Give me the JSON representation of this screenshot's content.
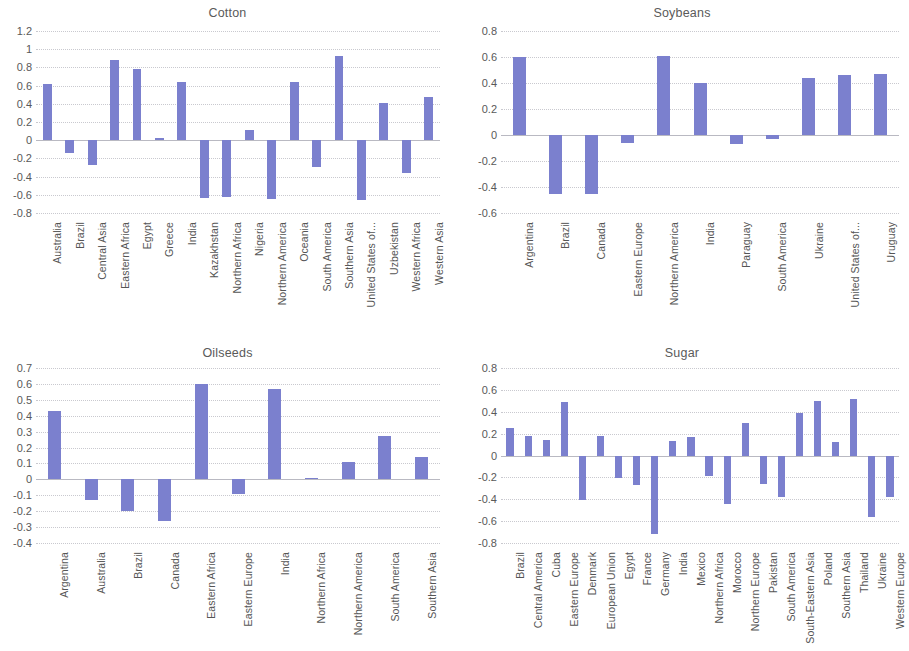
{
  "figure": {
    "background": "#ffffff",
    "bar_color": "#7b80ce",
    "gridline_color": "#c9c9cf"
  },
  "panels": [
    {
      "id": "cotton",
      "title": "Cotton"
    },
    {
      "id": "soybeans",
      "title": "Soybeans"
    },
    {
      "id": "oilseeds",
      "title": "Oilseeds"
    },
    {
      "id": "sugar",
      "title": "Sugar"
    }
  ],
  "chart_data": [
    {
      "type": "bar",
      "title": "Cotton",
      "xlabel": "",
      "ylabel": "",
      "ylim": [
        -0.8,
        1.2
      ],
      "ytick_step": 0.2,
      "yticks": [
        "1.2",
        "1",
        "0.8",
        "0.6",
        "0.4",
        "0.2",
        "0",
        "-0.2",
        "-0.4",
        "-0.6",
        "-0.8"
      ],
      "grid": true,
      "legend": "none",
      "categories": [
        "Australia",
        "Brazil",
        "Central Asia",
        "Eastern Africa",
        "Egypt",
        "Greece",
        "India",
        "Kazakhstan",
        "Northern Africa",
        "Nigeria",
        "Northern America",
        "Oceania",
        "South America",
        "Southern Asia",
        "United States of...",
        "Uzbekistan",
        "Western Africa",
        "Western Asia"
      ],
      "values": [
        0.62,
        -0.14,
        -0.27,
        0.88,
        0.78,
        0.02,
        0.64,
        -0.63,
        -0.62,
        0.11,
        -0.65,
        0.64,
        -0.3,
        0.93,
        -0.66,
        0.41,
        -0.36,
        0.48
      ]
    },
    {
      "type": "bar",
      "title": "Soybeans",
      "xlabel": "",
      "ylabel": "",
      "ylim": [
        -0.6,
        0.8
      ],
      "ytick_step": 0.2,
      "yticks": [
        "0.8",
        "0.6",
        "0.4",
        "0.2",
        "0",
        "-0.2",
        "-0.4",
        "-0.6"
      ],
      "grid": true,
      "legend": "none",
      "categories": [
        "Argentina",
        "Brazil",
        "Canada",
        "Eastern Europe",
        "Northern America",
        "India",
        "Paraguay",
        "South America",
        "Ukraine",
        "United States of...",
        "Uruguay"
      ],
      "values": [
        0.6,
        -0.45,
        -0.45,
        -0.06,
        0.61,
        0.4,
        -0.07,
        -0.03,
        0.44,
        0.46,
        0.47
      ]
    },
    {
      "type": "bar",
      "title": "Oilseeds",
      "xlabel": "",
      "ylabel": "",
      "ylim": [
        -0.4,
        0.7
      ],
      "ytick_step": 0.1,
      "yticks": [
        "0.7",
        "0.6",
        "0.5",
        "0.4",
        "0.3",
        "0.2",
        "0.1",
        "0",
        "-0.1",
        "-0.2",
        "-0.3",
        "-0.4"
      ],
      "grid": true,
      "legend": "none",
      "categories": [
        "Argentina",
        "Australia",
        "Brazil",
        "Canada",
        "Eastern Africa",
        "Eastern Europe",
        "India",
        "Northern Africa",
        "Northern America",
        "South America",
        "Southern Asia"
      ],
      "values": [
        0.43,
        -0.13,
        -0.2,
        -0.26,
        0.6,
        -0.09,
        0.57,
        0.01,
        0.11,
        0.27,
        0.14
      ]
    },
    {
      "type": "bar",
      "title": "Sugar",
      "xlabel": "",
      "ylabel": "",
      "ylim": [
        -0.8,
        0.8
      ],
      "ytick_step": 0.2,
      "yticks": [
        "0.8",
        "0.6",
        "0.4",
        "0.2",
        "0",
        "-0.2",
        "-0.4",
        "-0.6",
        "-0.8"
      ],
      "grid": true,
      "legend": "none",
      "categories": [
        "Brazil",
        "Central America",
        "Cuba",
        "Eastern Europe",
        "Denmark",
        "European Union",
        "Egypt",
        "France",
        "Germany",
        "India",
        "Mexico",
        "Northern Africa",
        "Morocco",
        "Northern Europe",
        "Pakistan",
        "South America",
        "South-Eastern Asia",
        "Poland",
        "Southern Asia",
        "Thailand",
        "Ukraine",
        "Western Europe"
      ],
      "values": [
        0.25,
        0.18,
        0.14,
        0.49,
        -0.41,
        0.18,
        -0.21,
        -0.27,
        -0.72,
        0.13,
        0.17,
        -0.19,
        -0.44,
        0.3,
        -0.26,
        -0.38,
        0.39,
        0.5,
        0.12,
        0.52,
        -0.56,
        -0.38
      ]
    }
  ]
}
